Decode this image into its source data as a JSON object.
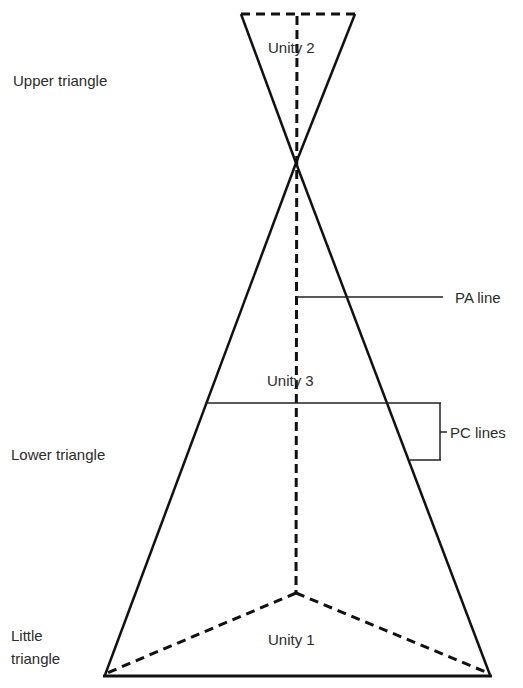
{
  "diagram": {
    "labels": {
      "upper_triangle": "Upper triangle",
      "lower_triangle": "Lower triangle",
      "little_triangle_line1": "Little",
      "little_triangle_line2": "triangle",
      "unity_1": "Unity 1",
      "unity_2": "Unity 2",
      "unity_3": "Unity 3",
      "pa_line": "PA line",
      "pc_lines": "PC lines"
    },
    "colors": {
      "line": "#111111",
      "text": "#2b2b2b",
      "background": "#ffffff"
    }
  }
}
